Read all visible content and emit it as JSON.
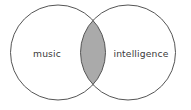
{
  "figure": {
    "type": "venn-diagram",
    "title": "",
    "background_color": "#ffffff",
    "width": 191,
    "height": 110
  },
  "diagram_data": {
    "type": "venn",
    "set_count": 2,
    "sets": [
      {
        "id": "left",
        "label": "music",
        "center_x": 58,
        "center_y": 52.5,
        "radius": 47.5,
        "fill": "#ffffff",
        "stroke": "#555555"
      },
      {
        "id": "right",
        "label": "intelligence",
        "center_x": 128,
        "center_y": 52.5,
        "radius": 47.5,
        "fill": "#ffffff",
        "stroke": "#555555"
      }
    ],
    "intersection": {
      "label": "",
      "fill": "#aaaaaa",
      "stroke": "#555555",
      "left_x": 80.5,
      "right_x": 105.5,
      "top_y": 18,
      "bottom_y": 87
    },
    "stroke_width": 1,
    "label_color": "#3a3a3a"
  },
  "labels": {
    "left": "music",
    "right": "intelligence"
  }
}
